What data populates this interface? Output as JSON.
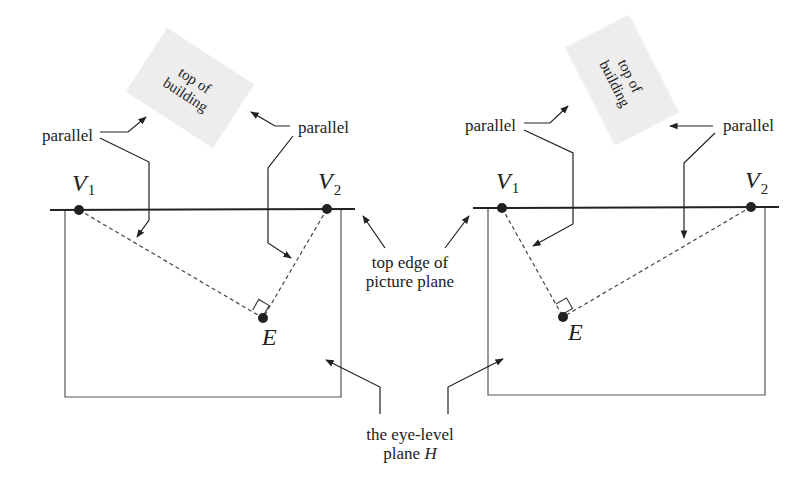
{
  "figure": {
    "left_panel": {
      "vanishing_point_1": {
        "label": "V",
        "subscript": "1"
      },
      "vanishing_point_2": {
        "label": "V",
        "subscript": "2"
      },
      "eye_point": {
        "label": "E"
      },
      "building_label_line1": "top of",
      "building_label_line2": "building",
      "parallel_label_left": "parallel",
      "parallel_label_right": "parallel"
    },
    "right_panel": {
      "vanishing_point_1": {
        "label": "V",
        "subscript": "1"
      },
      "vanishing_point_2": {
        "label": "V",
        "subscript": "2"
      },
      "eye_point": {
        "label": "E"
      },
      "building_label_line1": "top of",
      "building_label_line2": "building",
      "parallel_label_left": "parallel",
      "parallel_label_right": "parallel"
    },
    "center_labels": {
      "picture_plane_line1": "top edge of",
      "picture_plane_line2": "picture plane",
      "eye_level_line1": "the eye-level",
      "eye_level_line2_prefix": "plane ",
      "eye_level_line2_var": "H"
    },
    "colors": {
      "ink": "#222222",
      "building_fill": "#ececec",
      "background": "#ffffff"
    }
  }
}
